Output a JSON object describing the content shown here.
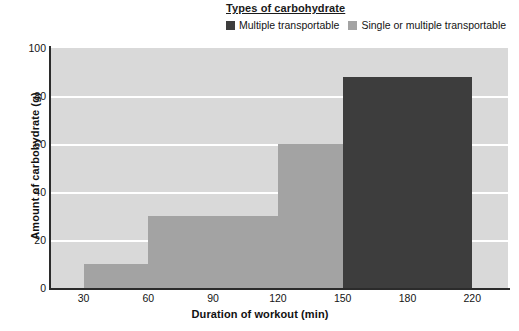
{
  "legend": {
    "title": "Types of carbohydrate",
    "entries": [
      {
        "label": "Multiple transportable",
        "color": "#3d3d3d",
        "swatch_name": "legend-swatch-multiple"
      },
      {
        "label": "Single or multiple transportable",
        "color": "#a3a3a3",
        "swatch_name": "legend-swatch-single"
      }
    ]
  },
  "chart_data": {
    "type": "bar",
    "title": "Types of carbohydrate",
    "xlabel": "Duration of workout (min)",
    "ylabel": "Amount of carbohydrate (g)",
    "xticks": [
      "30",
      "60",
      "90",
      "120",
      "150",
      "180",
      "220"
    ],
    "yticks": [
      "0",
      "20",
      "40",
      "60",
      "80",
      "100"
    ],
    "ylim": [
      0,
      100
    ],
    "grid": "horizontal",
    "legend_position": "top-right",
    "plot_background": "#d9d9d9",
    "series": [
      {
        "name": "Single or multiple transportable",
        "color": "#a3a3a3",
        "bars": [
          {
            "x_start": "30",
            "x_end": "60",
            "value": 10
          },
          {
            "x_start": "60",
            "x_end": "120",
            "value": 30
          },
          {
            "x_start": "120",
            "x_end": "180",
            "value": 60
          }
        ]
      },
      {
        "name": "Multiple transportable",
        "color": "#3d3d3d",
        "bars": [
          {
            "x_start": "150",
            "x_end": "220",
            "value": 88
          }
        ]
      }
    ]
  }
}
